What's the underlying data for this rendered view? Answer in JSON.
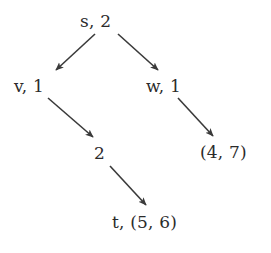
{
  "diagram": {
    "background_color": "#ffffff",
    "text_color": "#2b2b2b",
    "edge_color": "#3a3a3a",
    "nodes": [
      {
        "id": "s",
        "label": "s, 2",
        "x": 80,
        "y": 13
      },
      {
        "id": "v",
        "label": "v, 1",
        "x": 14,
        "y": 78
      },
      {
        "id": "w",
        "label": "w, 1",
        "x": 146,
        "y": 78
      },
      {
        "id": "two",
        "label": "2",
        "x": 94,
        "y": 145
      },
      {
        "id": "pair47",
        "label": "(4, 7)",
        "x": 200,
        "y": 144
      },
      {
        "id": "t",
        "label": "t, (5, 6)",
        "x": 112,
        "y": 214
      }
    ],
    "edges": [
      {
        "id": "s-v",
        "from": "s",
        "to": "v",
        "x1": 95,
        "y1": 34,
        "x2": 56,
        "y2": 70
      },
      {
        "id": "s-w",
        "from": "s",
        "to": "w",
        "x1": 118,
        "y1": 34,
        "x2": 158,
        "y2": 70
      },
      {
        "id": "v-2",
        "from": "v",
        "to": "two",
        "x1": 48,
        "y1": 98,
        "x2": 93,
        "y2": 137
      },
      {
        "id": "w-p",
        "from": "w",
        "to": "pair47",
        "x1": 178,
        "y1": 98,
        "x2": 213,
        "y2": 136
      },
      {
        "id": "2-t",
        "from": "two",
        "to": "t",
        "x1": 110,
        "y1": 166,
        "x2": 146,
        "y2": 205
      }
    ]
  }
}
